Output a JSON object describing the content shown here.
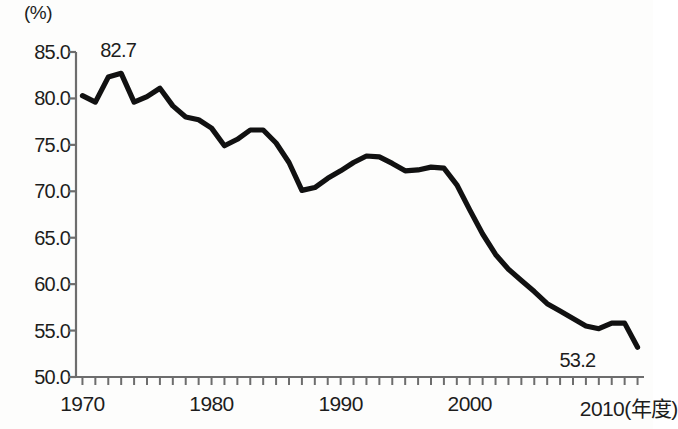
{
  "chart_data": {
    "type": "line",
    "title": "",
    "subtitle": "",
    "unit_label": "(%)",
    "xlabel": "(年度)",
    "ylabel": "(%)",
    "xlim": [
      1969.5,
      2013.5
    ],
    "ylim": [
      50.0,
      85.0
    ],
    "grid": false,
    "legend": null,
    "y_ticks": [
      "85.0",
      "80.0",
      "75.0",
      "70.0",
      "65.0",
      "60.0",
      "55.0",
      "50.0"
    ],
    "y_tick_values": [
      85.0,
      80.0,
      75.0,
      70.0,
      65.0,
      60.0,
      55.0,
      50.0
    ],
    "x_ticks": [
      "1970",
      "1980",
      "1990",
      "2000",
      "2010(年度)"
    ],
    "x_tick_values": [
      1970,
      1980,
      1990,
      2000,
      2010
    ],
    "x_minor_tick_interval": 1,
    "annotations": [
      {
        "label": "82.7",
        "x": 1972,
        "y": 82.7
      },
      {
        "label": "53.2",
        "x": 2013,
        "y": 53.2
      }
    ],
    "series": [
      {
        "name": "",
        "color": "#111111",
        "x": [
          1970,
          1971,
          1972,
          1973,
          1974,
          1975,
          1976,
          1977,
          1978,
          1979,
          1980,
          1981,
          1982,
          1983,
          1984,
          1985,
          1986,
          1987,
          1988,
          1989,
          1990,
          1991,
          1992,
          1993,
          1994,
          1995,
          1996,
          1997,
          1998,
          1999,
          2000,
          2001,
          2002,
          2003,
          2004,
          2005,
          2006,
          2007,
          2008,
          2009,
          2010,
          2011,
          2012,
          2013
        ],
        "values": [
          80.3,
          79.6,
          82.3,
          82.7,
          79.6,
          80.2,
          81.1,
          79.2,
          78.0,
          77.7,
          76.8,
          74.9,
          75.6,
          76.6,
          76.6,
          75.2,
          73.1,
          70.1,
          70.4,
          71.4,
          72.2,
          73.1,
          73.8,
          73.7,
          73.0,
          72.2,
          72.3,
          72.6,
          72.5,
          70.7,
          68.0,
          65.4,
          63.2,
          61.6,
          60.4,
          59.2,
          57.9,
          57.1,
          56.3,
          55.5,
          55.2,
          55.8,
          55.8,
          53.2
        ]
      }
    ]
  },
  "axis_geometry": {
    "plot_left": 76,
    "plot_right": 644,
    "plot_top": 52,
    "plot_bottom": 377
  }
}
